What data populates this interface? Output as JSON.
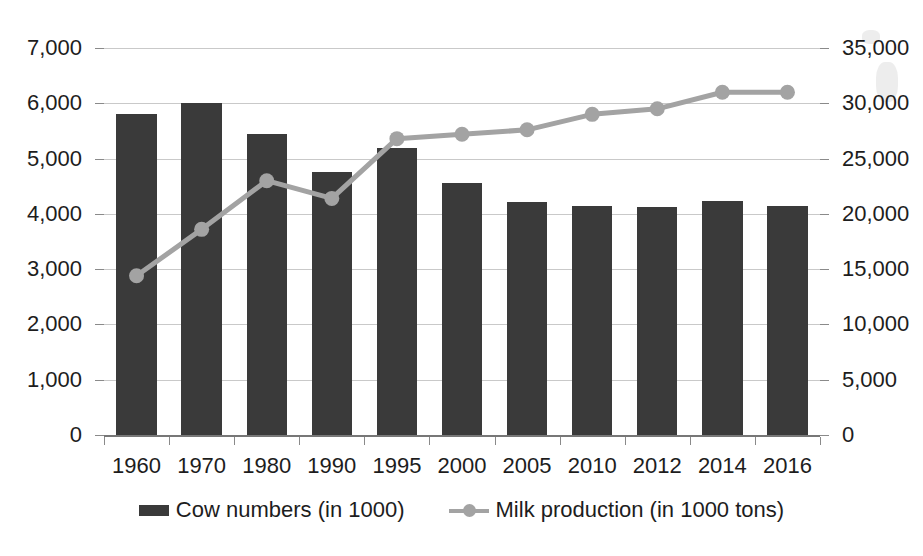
{
  "chart_data": {
    "type": "bar",
    "title": "",
    "xlabel": "",
    "categories": [
      "1960",
      "1970",
      "1980",
      "1990",
      "1995",
      "2000",
      "2005",
      "2010",
      "2012",
      "2014",
      "2016"
    ],
    "grid": true,
    "legend_position": "bottom",
    "series": [
      {
        "name": "Cow numbers (in 1000)",
        "type": "bar",
        "axis": "left",
        "color": "#3a3a3a",
        "values": [
          5800,
          6000,
          5450,
          4750,
          5200,
          4550,
          4220,
          4140,
          4130,
          4240,
          4150
        ]
      },
      {
        "name": "Milk production (in 1000 tons)",
        "type": "line",
        "axis": "right",
        "color": "#a3a3a3",
        "values": [
          14400,
          18600,
          23000,
          21400,
          26800,
          27200,
          27600,
          29000,
          29500,
          31000,
          31000
        ]
      }
    ],
    "y_left": {
      "label": "",
      "ylim": [
        0,
        7000
      ],
      "tick_step": 1000,
      "ticks": [
        "0",
        "1,000",
        "2,000",
        "3,000",
        "4,000",
        "5,000",
        "6,000",
        "7,000"
      ],
      "tick_values": [
        0,
        1000,
        2000,
        3000,
        4000,
        5000,
        6000,
        7000
      ]
    },
    "y_right": {
      "label": "",
      "ylim": [
        0,
        35000
      ],
      "tick_step": 5000,
      "ticks": [
        "0",
        "5,000",
        "10,000",
        "15,000",
        "20,000",
        "25,000",
        "30,000",
        "35,000"
      ],
      "tick_values": [
        0,
        5000,
        10000,
        15000,
        20000,
        25000,
        30000,
        35000
      ]
    }
  },
  "legend": {
    "items": [
      {
        "label": "Cow numbers (in 1000)",
        "marker": "bar-swatch",
        "color": "#3a3a3a"
      },
      {
        "label": "Milk production (in 1000 tons)",
        "marker": "line-marker-swatch",
        "color": "#a3a3a3"
      }
    ]
  },
  "colors": {
    "bar": "#3a3a3a",
    "line": "#a3a3a3",
    "gridline": "#c9c9c9",
    "axis": "#8a8a8a",
    "text": "#1d1d1d",
    "background": "#ffffff"
  }
}
